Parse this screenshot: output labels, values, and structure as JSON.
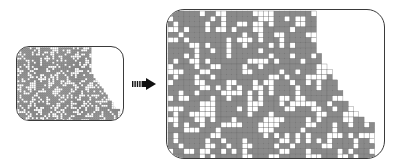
{
  "figure": {
    "colors": {
      "filled": "#8a8a8a",
      "empty": "#ffffff",
      "gridline": "#6e6e6e",
      "border": "#3a3a3a",
      "arrow": "#111111"
    },
    "small_panel": {
      "cell_size": 2.05,
      "cols": 50,
      "rows": 36,
      "row_widths_from_top": "pattern widens from ~36 cols at top to ~50 cols at bottom in a staircase"
    },
    "large_panel": {
      "cell_size": 5.3,
      "cols": 39,
      "rows": 28,
      "profile": [
        28,
        28,
        28,
        28,
        28,
        28,
        28,
        28,
        29,
        29,
        30,
        31,
        31,
        32,
        32,
        33,
        33,
        34,
        35,
        36,
        37,
        39,
        39,
        39,
        39,
        39,
        39,
        39
      ]
    },
    "arrow": {
      "style": "dashed-tail right arrow",
      "direction": "right"
    }
  }
}
